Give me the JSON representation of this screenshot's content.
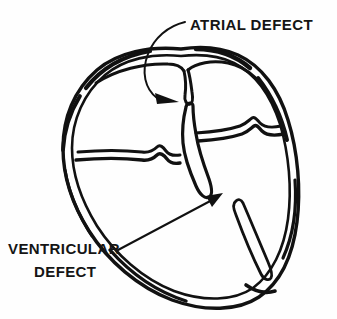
{
  "figure": {
    "kind": "line-art-medical-illustration",
    "background_color": "#fefefe",
    "ink_color": "#111111",
    "width": 337,
    "height": 319
  },
  "labels": {
    "atrial": {
      "text": "ATRIAL DEFECT",
      "x": 190,
      "y": 30
    },
    "ventricular_line1": {
      "text": "VENTRICULAR",
      "x": 8,
      "y": 254
    },
    "ventricular_line2": {
      "text": "DEFECT",
      "x": 34,
      "y": 277
    }
  },
  "annotations": {
    "atrial_pointer_name": "atrial-defect-arrow",
    "ventricular_pointer_name": "ventricular-defect-arrow"
  },
  "anatomy": {
    "outer_wall": "heart outer myocardial wall, double-contour outline",
    "atrial_septum_stub": "interatrial septum remnant hanging from roof",
    "av_groove_left": "left atrioventricular valve groove with notch",
    "av_groove_right": "right atrioventricular valve groove with notch",
    "ventricular_septum": "interventricular septum upper stalk",
    "lower_septum": "lower interventricular septum segment near apex"
  }
}
